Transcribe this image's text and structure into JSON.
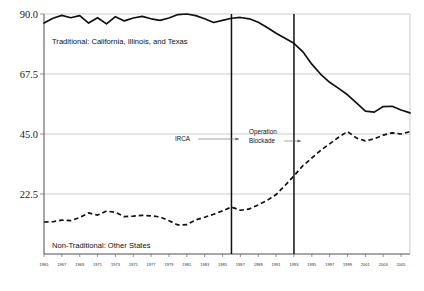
{
  "chart_data": {
    "type": "line",
    "title": "",
    "xlabel": "",
    "ylabel": "",
    "ylim": [
      0,
      90
    ],
    "xlim": [
      1965,
      2006
    ],
    "grid": true,
    "legend": "inline-annotations",
    "ytick_labels": [
      "90.0",
      "67.5",
      "45.0",
      "22.5"
    ],
    "ytick_values": [
      90.0,
      67.5,
      45.0,
      22.5
    ],
    "xtick_labels": [
      "1965",
      "1967",
      "1969",
      "1971",
      "1973",
      "1975",
      "1977",
      "1979",
      "1981",
      "1983",
      "1985",
      "1987",
      "1989",
      "1991",
      "1993",
      "1995",
      "1997",
      "1999",
      "2001",
      "2003",
      "2005"
    ],
    "x": [
      1965,
      1966,
      1967,
      1968,
      1969,
      1970,
      1971,
      1972,
      1973,
      1974,
      1975,
      1976,
      1977,
      1978,
      1979,
      1980,
      1981,
      1982,
      1983,
      1984,
      1985,
      1986,
      1987,
      1988,
      1989,
      1990,
      1991,
      1992,
      1993,
      1994,
      1995,
      1996,
      1997,
      1998,
      1999,
      2000,
      2001,
      2002,
      2003,
      2004,
      2005,
      2006
    ],
    "series": [
      {
        "name": "Traditional: California, Illinois, and Texas",
        "style": "solid",
        "color": "#111111",
        "values": [
          86.6,
          88.4,
          89.5,
          88.6,
          89.4,
          86.6,
          88.6,
          86.3,
          89.0,
          87.4,
          88.5,
          89.1,
          88.2,
          87.6,
          88.5,
          89.8,
          90.0,
          89.4,
          88.2,
          86.8,
          87.6,
          88.4,
          88.7,
          88.2,
          86.9,
          84.9,
          82.8,
          80.9,
          79.0,
          75.8,
          71.2,
          67.4,
          64.4,
          62.1,
          59.7,
          56.7,
          53.6,
          53.2,
          55.3,
          55.4,
          54.0,
          52.9
        ]
      },
      {
        "name": "Non-Traditional: Other States",
        "style": "dashed",
        "color": "#111111",
        "values": [
          12.0,
          12.1,
          12.7,
          12.5,
          13.7,
          15.4,
          14.6,
          16.1,
          15.6,
          14.0,
          14.2,
          14.5,
          14.3,
          13.9,
          12.5,
          10.9,
          11.0,
          12.8,
          13.8,
          14.9,
          16.2,
          17.6,
          16.4,
          16.9,
          18.4,
          20.1,
          22.3,
          25.7,
          29.3,
          33.1,
          36.0,
          38.9,
          41.3,
          43.8,
          45.9,
          43.5,
          42.4,
          43.2,
          44.6,
          45.4,
          45.0,
          45.9
        ]
      }
    ],
    "annotations": [
      {
        "label": "IRCA",
        "year": 1986,
        "label_text_lines": [
          "IRCA"
        ]
      },
      {
        "label": "Operation Blockade",
        "year": 1993,
        "label_text_lines": [
          "Operation",
          "Blockade"
        ]
      }
    ],
    "series_labels": {
      "traditional": "Traditional:  California, Illinois, and Texas",
      "nontraditional": "Non-Traditional:  Other States"
    }
  }
}
